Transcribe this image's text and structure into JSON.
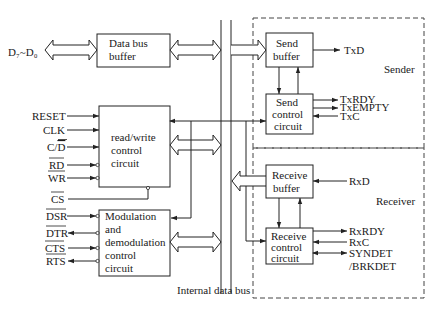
{
  "diagram": {
    "external_data_pins": "D₇~D₀",
    "blocks": {
      "data_bus_buffer": [
        "Data bus",
        "buffer"
      ],
      "rw_control": [
        "read/write",
        "control",
        "circuit"
      ],
      "modem_control": [
        "Modulation",
        "and",
        "demodulation",
        "control",
        "circuit"
      ],
      "send_buffer": [
        "Send",
        "buffer"
      ],
      "send_control": [
        "Send",
        "control",
        "circuit"
      ],
      "receive_buffer": [
        "Receive",
        "buffer"
      ],
      "receive_control": [
        "Receive",
        "control",
        "circuit"
      ]
    },
    "groups": {
      "sender": "Sender",
      "receiver": "Receiver"
    },
    "bus_label": "Internal data bus",
    "rw_inputs": [
      {
        "name": "RESET",
        "overline": ""
      },
      {
        "name": "CLK",
        "overline": ""
      },
      {
        "name": "C/D",
        "overline": "D"
      },
      {
        "name": "RD",
        "overline": "RD"
      },
      {
        "name": "WR",
        "overline": "WR"
      },
      {
        "name": "CS",
        "overline": "CS"
      }
    ],
    "labels": {
      "reset": "RESET",
      "clk": "CLK",
      "cd_c": "C/",
      "cd_d": "D",
      "rd": "RD",
      "wr": "WR",
      "cs": "CS",
      "dsr": "DSR",
      "dtr": "DTR",
      "cts": "CTS",
      "rts": "RTS",
      "txd": "TxD",
      "txrdy": "TxRDY",
      "txempty": "TxEMPTY",
      "txc": "TxC",
      "rxd": "RxD",
      "rxrdy": "RxRDY",
      "rxc": "RxC",
      "syndet": "SYNDET",
      "brkdet": "/BRKDET"
    },
    "modem_signals": [
      {
        "name": "DSR",
        "direction": "in"
      },
      {
        "name": "DTR",
        "direction": "out"
      },
      {
        "name": "CTS",
        "direction": "in"
      },
      {
        "name": "RTS",
        "direction": "out"
      }
    ],
    "sender_signals": [
      {
        "name": "TxD",
        "direction": "out"
      },
      {
        "name": "TxRDY",
        "direction": "out"
      },
      {
        "name": "TxEMPTY",
        "direction": "out"
      },
      {
        "name": "TxC",
        "direction": "in"
      }
    ],
    "receiver_signals": [
      {
        "name": "RxD",
        "direction": "in"
      },
      {
        "name": "RxRDY",
        "direction": "out"
      },
      {
        "name": "RxC",
        "direction": "in"
      },
      {
        "name": "SYNDET/BRKDET",
        "direction": "bidirectional"
      }
    ]
  }
}
